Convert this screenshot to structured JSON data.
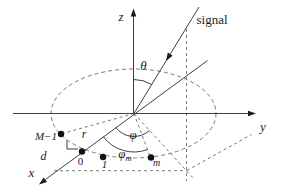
{
  "figure": {
    "type": "uniform-circular-array-signal-geometry",
    "colors": {
      "background": "#ffffff",
      "solid_line": "#3f3f3f",
      "dashed_line": "#787878",
      "marker": "#111111",
      "text": "#1c1c1c"
    },
    "axes": {
      "x": "x",
      "y": "y",
      "z": "z"
    },
    "signal_label": "signal",
    "angles": {
      "theta": "θ",
      "phi": "φ",
      "phi_m_base": "φ",
      "phi_m_sub": "m"
    },
    "array": {
      "radius_label": "r",
      "spacing_label": "d",
      "elements": [
        "M−1",
        "0",
        "1",
        "m"
      ]
    }
  }
}
